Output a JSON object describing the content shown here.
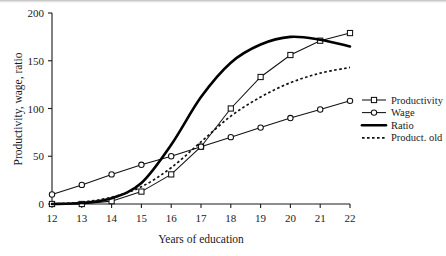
{
  "chart_data": {
    "type": "line",
    "title": "",
    "xlabel": "Years of education",
    "ylabel": "Productivity, wage, ratio",
    "x": [
      12,
      13,
      14,
      15,
      16,
      17,
      18,
      19,
      20,
      21,
      22
    ],
    "xlim": [
      12,
      22
    ],
    "ylim": [
      0,
      200
    ],
    "xticks": [
      "12",
      "13",
      "14",
      "15",
      "16",
      "17",
      "18",
      "19",
      "20",
      "21",
      "22"
    ],
    "yticks": [
      "0",
      "50",
      "100",
      "150",
      "200"
    ],
    "grid": false,
    "legend_position": "right",
    "series": [
      {
        "name": "Productivity",
        "marker": "square",
        "style": "solid-thin",
        "values": [
          0,
          0,
          3,
          13,
          31,
          60,
          100,
          133,
          156,
          171,
          179
        ]
      },
      {
        "name": "Wage",
        "marker": "circle",
        "style": "solid-thin",
        "values": [
          10,
          20,
          31,
          41,
          50,
          60,
          70,
          80,
          90,
          99,
          108
        ]
      },
      {
        "name": "Ratio",
        "marker": "none",
        "style": "solid-thick",
        "values": [
          0,
          1,
          6,
          22,
          62,
          112,
          148,
          167,
          175,
          172,
          165
        ]
      },
      {
        "name": "Product. old",
        "marker": "none",
        "style": "dotted",
        "values": [
          0,
          2,
          7,
          18,
          38,
          65,
          92,
          112,
          127,
          137,
          143
        ]
      }
    ]
  },
  "axes": {
    "y_label": "Productivity, wage, ratio",
    "x_label": "Years of education",
    "y_tick_labels": [
      "0",
      "50",
      "100",
      "150",
      "200"
    ],
    "x_tick_labels": [
      "12",
      "13",
      "14",
      "15",
      "16",
      "17",
      "18",
      "19",
      "20",
      "21",
      "22"
    ]
  },
  "legend": {
    "items": [
      {
        "label": "Productivity",
        "swatch": "line-square-marker"
      },
      {
        "label": "Wage",
        "swatch": "line-circle-marker"
      },
      {
        "label": "Ratio",
        "swatch": "thick-solid-line"
      },
      {
        "label": "Product. old",
        "swatch": "dotted-line"
      }
    ]
  },
  "colors": {
    "ink": "#111111",
    "paper": "#ffffff",
    "scan_edge": "#b8b8b8"
  }
}
